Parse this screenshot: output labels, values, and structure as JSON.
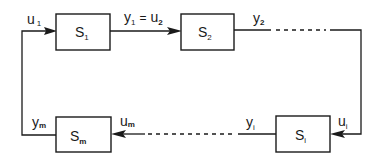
{
  "diagram": {
    "type": "closed-loop interconnection of subsystems",
    "blocks": [
      {
        "id": "S1",
        "label": "S",
        "sub": "1"
      },
      {
        "id": "S2",
        "label": "S",
        "sub": "2"
      },
      {
        "id": "Si",
        "label": "S",
        "sub": "i"
      },
      {
        "id": "Sm",
        "label": "S",
        "sub": "m"
      }
    ],
    "signals": {
      "u1": {
        "main": "u",
        "sub": "1"
      },
      "y1_eq_u2": {
        "y": "y",
        "ysub": "1",
        "eq": "=",
        "u": "u",
        "usub": "2"
      },
      "y2": {
        "main": "y",
        "sub": "2"
      },
      "ui": {
        "main": "u",
        "sub": "i"
      },
      "yi": {
        "main": "y",
        "sub": "i"
      },
      "um": {
        "main": "u",
        "sub": "m"
      },
      "ym": {
        "main": "y",
        "sub": "m"
      }
    },
    "colors": {
      "stroke": "#1a1a1a",
      "background": "#ffffff"
    }
  }
}
